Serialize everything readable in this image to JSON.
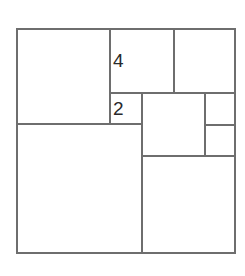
{
  "diagram": {
    "type": "squared-rectangle",
    "stroke_color": "#6e6e6e",
    "squares": [
      {
        "id": "top-left",
        "x": 16,
        "y": 28,
        "w": 95,
        "h": 97,
        "label": ""
      },
      {
        "id": "square-4",
        "x": 109,
        "y": 28,
        "w": 66,
        "h": 66,
        "label": "4"
      },
      {
        "id": "top-right",
        "x": 173,
        "y": 28,
        "w": 63,
        "h": 66,
        "label": ""
      },
      {
        "id": "square-2",
        "x": 109,
        "y": 92,
        "w": 34,
        "h": 33,
        "label": "2"
      },
      {
        "id": "middle",
        "x": 141,
        "y": 92,
        "w": 65,
        "h": 65,
        "label": ""
      },
      {
        "id": "small-upper",
        "x": 204,
        "y": 92,
        "w": 32,
        "h": 34,
        "label": ""
      },
      {
        "id": "small-lower",
        "x": 204,
        "y": 124,
        "w": 32,
        "h": 33,
        "label": ""
      },
      {
        "id": "bottom-left",
        "x": 16,
        "y": 123,
        "w": 127,
        "h": 131,
        "label": ""
      },
      {
        "id": "bottom-right",
        "x": 141,
        "y": 155,
        "w": 95,
        "h": 99,
        "label": ""
      }
    ],
    "labels": {
      "square_4": "4",
      "square_2": "2"
    }
  }
}
